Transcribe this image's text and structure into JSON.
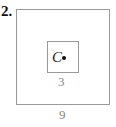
{
  "problem_number": "2.",
  "diagram": {
    "outer_square": {
      "side_label": "9"
    },
    "inner_square": {
      "side_label": "3"
    },
    "point": {
      "label": "C"
    }
  }
}
